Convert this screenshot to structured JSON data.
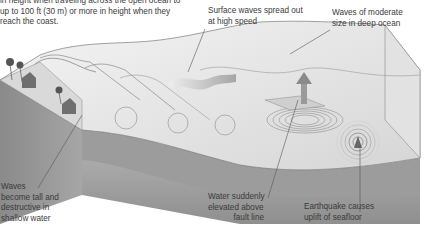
{
  "diagram": {
    "intro_lines": [
      "in height when traveling across the open ocean to",
      "up to 100 ft (30 m) or more in height when they",
      "reach the coast."
    ],
    "labels": {
      "surface_waves": [
        "Surface waves spread out",
        "at high speed"
      ],
      "moderate_waves": [
        "Waves of moderate",
        "size in deep ocean"
      ],
      "tall_waves": [
        "Waves",
        "become tall and",
        "destructive in",
        "shallow water"
      ],
      "water_elevated": [
        "Water suddenly",
        "elevated above",
        "fault line"
      ],
      "earthquake": [
        "Earthquake causes",
        "uplift of seafloor"
      ]
    },
    "colors": {
      "block_side_dark": "#8e8e8e",
      "block_side_mid": "#a9a9a9",
      "water_surface": "#e6e6e6",
      "seafloor": "#9a9a9a",
      "leader_line": "#555555"
    }
  }
}
